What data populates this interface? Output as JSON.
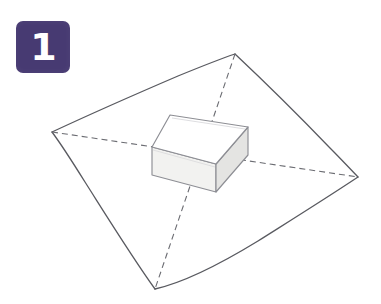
{
  "page": {
    "background_color": "#ffffff",
    "width": 381,
    "height": 304
  },
  "step_badge": {
    "number": "1",
    "background_color": "#473a72",
    "text_color": "#ffffff",
    "shape": "rounded-square",
    "icon_name": "step-number-badge"
  },
  "diagram": {
    "name": "wrapping-sheet-with-box",
    "style": {
      "outline_color": "#595a60",
      "outline_width": 1.3,
      "dash_color": "#6b6c72",
      "dash_width": 1.1,
      "dash_pattern": "6,4",
      "box_top_fill": "#ffffff",
      "box_front_fill": "#f2f2f0",
      "box_side_fill": "#e4e4e2",
      "box_edge_color": "#8d8e94"
    },
    "sheet": {
      "label": "wrapping-sheet",
      "vertices": [
        {
          "name": "top",
          "x": 235,
          "y": 54
        },
        {
          "name": "right",
          "x": 358,
          "y": 177
        },
        {
          "name": "bottom",
          "x": 155,
          "y": 289
        },
        {
          "name": "left",
          "x": 52,
          "y": 132
        }
      ]
    },
    "diagonals": [
      {
        "name": "diagonal-top-bottom",
        "from": "top",
        "to": "bottom"
      },
      {
        "name": "diagonal-left-right",
        "from": "left",
        "to": "right"
      }
    ],
    "box": {
      "label": "gift-box",
      "top_face": [
        {
          "x": 170,
          "y": 115
        },
        {
          "x": 248,
          "y": 127
        },
        {
          "x": 216,
          "y": 164
        },
        {
          "x": 152,
          "y": 147
        }
      ],
      "height": 28
    }
  }
}
